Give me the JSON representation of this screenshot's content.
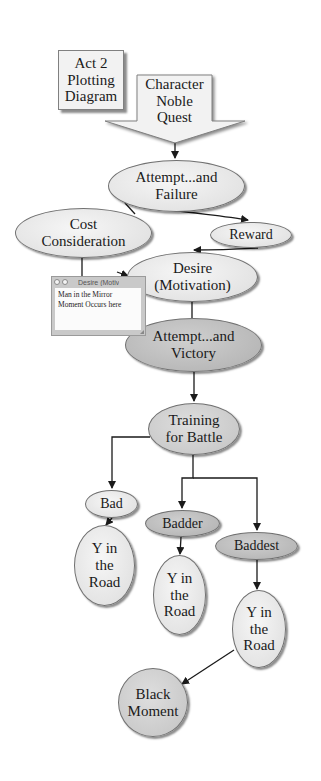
{
  "diagram": {
    "title": "Act 2\nPlotting\nDiagram",
    "colors": {
      "light_node": "#e4e4e4",
      "dark_node": "#b9b9b9",
      "edge": "#1a1a1a",
      "background": "#ffffff"
    },
    "nodes": {
      "character_noble_quest": {
        "label": "Character\nNoble\nQuest",
        "shape": "down-arrow"
      },
      "attempt_failure": {
        "label": "Attempt...and\nFailure",
        "shape": "ellipse",
        "fill": "light"
      },
      "cost_consideration": {
        "label": "Cost\nConsideration",
        "shape": "ellipse",
        "fill": "light"
      },
      "reward": {
        "label": "Reward",
        "shape": "ellipse",
        "fill": "light"
      },
      "desire_motivation": {
        "label": "Desire\n(Motivation)",
        "shape": "ellipse",
        "fill": "light"
      },
      "attempt_victory": {
        "label": "Attempt...and\nVictory",
        "shape": "ellipse",
        "fill": "dark"
      },
      "training_for_battle": {
        "label": "Training\nfor Battle",
        "shape": "ellipse",
        "fill": "mid"
      },
      "bad": {
        "label": "Bad",
        "shape": "ellipse",
        "fill": "light"
      },
      "badder": {
        "label": "Badder",
        "shape": "ellipse",
        "fill": "dark"
      },
      "baddest": {
        "label": "Baddest",
        "shape": "ellipse",
        "fill": "dark"
      },
      "y_in_road_1": {
        "label": "Y in\nthe\nRoad",
        "shape": "ellipse",
        "fill": "light"
      },
      "y_in_road_2": {
        "label": "Y in\nthe\nRoad",
        "shape": "ellipse",
        "fill": "light"
      },
      "y_in_road_3": {
        "label": "Y in\nthe\nRoad",
        "shape": "ellipse",
        "fill": "light"
      },
      "black_moment": {
        "label": "Black\nMoment",
        "shape": "circle",
        "fill": "mid"
      }
    },
    "note": {
      "title": "Desire (Motiv",
      "body": "Man in the Mirror\nMoment Occurs here"
    },
    "edges": [
      {
        "from": "character_noble_quest",
        "to": "attempt_failure",
        "arrow": true
      },
      {
        "from": "attempt_failure",
        "to": "reward",
        "arrow": true
      },
      {
        "from": "attempt_failure",
        "to": "cost_consideration",
        "arrow": false
      },
      {
        "from": "reward",
        "to": "desire_motivation",
        "arrow": true
      },
      {
        "from": "cost_consideration",
        "to": "desire_motivation",
        "arrow": true
      },
      {
        "from": "desire_motivation",
        "to": "attempt_victory",
        "arrow": false
      },
      {
        "from": "attempt_victory",
        "to": "training_for_battle",
        "arrow": true
      },
      {
        "from": "training_for_battle",
        "to": "bad",
        "arrow": true
      },
      {
        "from": "training_for_battle",
        "to": "badder",
        "arrow": true
      },
      {
        "from": "training_for_battle",
        "to": "baddest",
        "arrow": true
      },
      {
        "from": "bad",
        "to": "y_in_road_1",
        "arrow": true
      },
      {
        "from": "badder",
        "to": "y_in_road_2",
        "arrow": true
      },
      {
        "from": "baddest",
        "to": "y_in_road_3",
        "arrow": true
      },
      {
        "from": "y_in_road_3",
        "to": "black_moment",
        "arrow": true
      }
    ]
  }
}
